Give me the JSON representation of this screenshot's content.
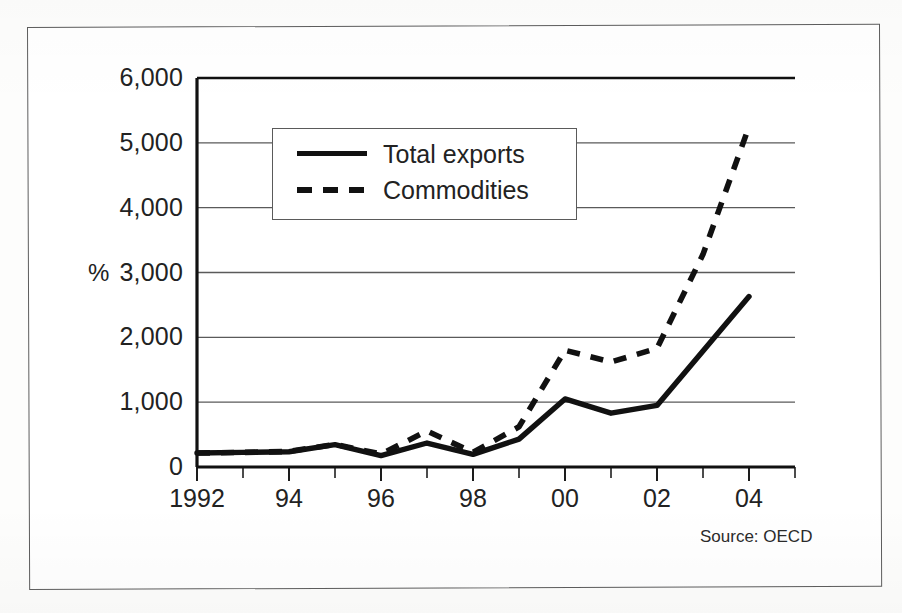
{
  "figure": {
    "unit_label": "%",
    "source_note": "Source: OECD",
    "frame_color": "#5d5d5d"
  },
  "legend": {
    "position": "inside-top-left",
    "items": [
      {
        "label": "Total exports",
        "style": "solid",
        "color": "#111111",
        "swatch": "solid-line-swatch"
      },
      {
        "label": "Commodities",
        "style": "dashed",
        "color": "#111111",
        "swatch": "dashed-line-swatch"
      }
    ]
  },
  "axes": {
    "y": {
      "ticks": [
        "0",
        "1,000",
        "2,000",
        "3,000",
        "4,000",
        "5,000",
        "6,000"
      ],
      "min": 0,
      "max": 6000,
      "step": 1000,
      "grid": true
    },
    "x": {
      "ticks": [
        "1992",
        "94",
        "96",
        "98",
        "00",
        "02",
        "04"
      ],
      "minor_ticks": [
        "1993",
        "95",
        "97",
        "99",
        "01",
        "03"
      ],
      "min": 1992,
      "max": 2005
    }
  },
  "chart_data": {
    "type": "line",
    "title": "",
    "subtitle": "",
    "xlabel": "",
    "ylabel": "%",
    "xlim": [
      1992,
      2005
    ],
    "ylim": [
      0,
      6000
    ],
    "grid": true,
    "legend_position": "upper left (inset box)",
    "annotations": [
      "Source: OECD"
    ],
    "x": [
      1992,
      1993,
      1994,
      1995,
      1996,
      1997,
      1998,
      1999,
      2000,
      2001,
      2002,
      2003,
      2004
    ],
    "categories": [
      "1992",
      "1993",
      "1994",
      "1995",
      "1996",
      "1997",
      "1998",
      "1999",
      "2000",
      "2001",
      "2002",
      "2003",
      "2004"
    ],
    "series": [
      {
        "name": "Total exports",
        "style": "solid",
        "color": "#111111",
        "values": [
          215,
          225,
          235,
          345,
          175,
          370,
          195,
          430,
          1050,
          830,
          950,
          1790,
          2630
        ]
      },
      {
        "name": "Commodities",
        "style": "dashed",
        "color": "#111111",
        "values": [
          215,
          225,
          240,
          350,
          200,
          555,
          225,
          620,
          1800,
          1620,
          1830,
          3280,
          5250
        ]
      }
    ]
  }
}
